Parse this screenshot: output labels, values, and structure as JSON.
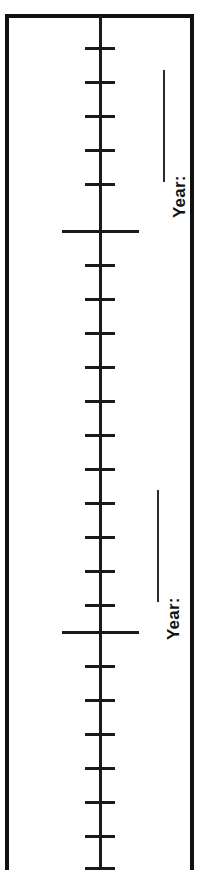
{
  "document": {
    "type": "timeline-worksheet",
    "orientation": "vertical",
    "background_color": "#ffffff",
    "ink_color": "#111111"
  },
  "frame": {
    "has_top_rule": true,
    "has_left_rule": true,
    "has_right_rule": true,
    "has_bottom_rule": false,
    "color": "#111111"
  },
  "axis": {
    "color": "#1a1a1a",
    "x_position": 100,
    "top": 16,
    "bottom": 870
  },
  "ticks": {
    "minor_count": 23,
    "minor_spacing": 34,
    "minor_width": 30,
    "minor_first_y": 48,
    "minor_positions": [
      48,
      82,
      116,
      150,
      184,
      265,
      299,
      333,
      367,
      401,
      435,
      469,
      503,
      537,
      571,
      605,
      666,
      700,
      734,
      768,
      802,
      836,
      868
    ],
    "major_count": 2,
    "major_width": 77,
    "major_positions": [
      231,
      632
    ]
  },
  "labels": [
    {
      "text": "Year:",
      "rotation": "-90deg",
      "anchor_x": 170,
      "anchor_y": 218,
      "blank_rule": {
        "x": 163,
        "top": 70,
        "height": 112
      }
    },
    {
      "text": "Year:",
      "rotation": "-90deg",
      "anchor_x": 164,
      "anchor_y": 640,
      "blank_rule": {
        "x": 157,
        "top": 490,
        "height": 112
      }
    }
  ]
}
